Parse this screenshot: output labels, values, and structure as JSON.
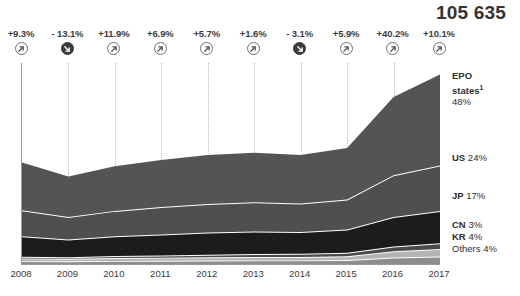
{
  "header": {
    "total_label": "105 635"
  },
  "growth": [
    {
      "value": "+9.3%",
      "direction": "up",
      "icon": "arrow-up-right-icon"
    },
    {
      "value": "- 13.1%",
      "direction": "down",
      "icon": "arrow-down-right-icon"
    },
    {
      "value": "+11.9%",
      "direction": "up",
      "icon": "arrow-up-right-icon"
    },
    {
      "value": "+6.9%",
      "direction": "up",
      "icon": "arrow-up-right-icon"
    },
    {
      "value": "+5.7%",
      "direction": "up",
      "icon": "arrow-up-right-icon"
    },
    {
      "value": "+1.6%",
      "direction": "up",
      "icon": "arrow-up-right-icon"
    },
    {
      "value": "- 3.1%",
      "direction": "down",
      "icon": "arrow-down-right-icon"
    },
    {
      "value": "+5.9%",
      "direction": "up",
      "icon": "arrow-up-right-icon"
    },
    {
      "value": "+40.2%",
      "direction": "up",
      "icon": "arrow-up-right-icon"
    },
    {
      "value": "+10.1%",
      "direction": "up",
      "icon": "arrow-up-right-icon"
    }
  ],
  "series_labels": [
    {
      "name": "EPO states",
      "share": "48%",
      "footnote": "1",
      "line1": "EPO",
      "line2": "states",
      "line3": "48%"
    },
    {
      "name": "US",
      "share": "24%",
      "text": "US 24%"
    },
    {
      "name": "JP",
      "share": "17%",
      "text": "JP 17%"
    },
    {
      "name": "CN",
      "share": "3%",
      "text": "CN 3%"
    },
    {
      "name": "KR",
      "share": "4%",
      "text": "KR 4%"
    },
    {
      "name": "Others",
      "share": "4%",
      "text": "Others 4%"
    }
  ],
  "colors": {
    "epo": "#545454",
    "us": "#4f4f4f",
    "jp": "#1c1c1c",
    "cn": "#4a4a4a",
    "kr": "#b4b4b4",
    "others": "#8d8d8d",
    "separator": "#ffffff",
    "axis": "#9a9a9a",
    "gridline": "#b9b9b9",
    "text": "#3a3a3a"
  },
  "chart_data": {
    "type": "area",
    "title": "",
    "subtitle": "",
    "xlabel": "",
    "ylabel": "",
    "grid": true,
    "stacked": true,
    "legend_position": "right",
    "total_2017": 105635,
    "categories": [
      "2008",
      "2009",
      "2010",
      "2011",
      "2012",
      "2013",
      "2014",
      "2015",
      "2016",
      "2017"
    ],
    "x": [
      2008,
      2009,
      2010,
      2011,
      2012,
      2013,
      2014,
      2015,
      2016,
      2017
    ],
    "yoy_growth_pct": [
      9.3,
      -13.1,
      11.9,
      6.9,
      5.7,
      1.6,
      -3.1,
      5.9,
      40.2,
      10.1
    ],
    "series": [
      {
        "name": "EPO states",
        "share_2017_pct": 48,
        "color": "#545454",
        "values": [
          26500,
          22500,
          24900,
          26300,
          27300,
          27600,
          27000,
          28800,
          43500,
          50700
        ]
      },
      {
        "name": "US",
        "share_2017_pct": 24,
        "color": "#4f4f4f",
        "values": [
          14600,
          12600,
          14200,
          15200,
          16000,
          16300,
          15800,
          16700,
          23300,
          25400
        ]
      },
      {
        "name": "JP",
        "share_2017_pct": 17,
        "color": "#1c1c1c",
        "values": [
          11400,
          9800,
          11000,
          11700,
          12300,
          12500,
          12200,
          12900,
          16400,
          18000
        ]
      },
      {
        "name": "CN",
        "share_2017_pct": 3,
        "color": "#4a4a4a",
        "values": [
          900,
          900,
          1100,
          1300,
          1500,
          1700,
          1800,
          2000,
          2700,
          3200
        ]
      },
      {
        "name": "KR",
        "share_2017_pct": 4,
        "color": "#b4b4b4",
        "values": [
          1500,
          1400,
          1600,
          1700,
          1800,
          1900,
          1900,
          2100,
          3500,
          4200
        ]
      },
      {
        "name": "Others",
        "share_2017_pct": 4,
        "color": "#8d8d8d",
        "values": [
          1600,
          1500,
          1700,
          1800,
          1900,
          2000,
          2000,
          2200,
          3600,
          4135
        ]
      }
    ],
    "ylim": [
      0,
      112000
    ]
  }
}
